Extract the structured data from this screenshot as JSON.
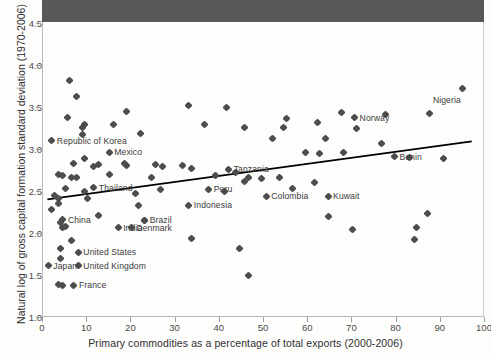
{
  "chart_data": {
    "type": "scatter",
    "title": "",
    "xlabel": "Primary commodities as a percentage of total exports (2000-2006)",
    "ylabel": "Natural log of gross capital formation standard deviation (1970-2006)",
    "xlim": [
      0,
      100
    ],
    "ylim": [
      1.0,
      4.5
    ],
    "xticks": [
      0,
      10,
      20,
      30,
      40,
      50,
      60,
      70,
      80,
      90,
      100
    ],
    "xticklabels": [
      "0",
      "10",
      "20",
      "30",
      "40",
      "50",
      "60",
      "70",
      "80",
      "90",
      "100"
    ],
    "yticks": [
      1.0,
      1.5,
      2.0,
      2.5,
      3.0,
      3.5,
      4.0,
      4.5
    ],
    "yticklabels": [
      "1.0",
      "1.5",
      "2.0",
      "2.5",
      "3.0",
      "3.5",
      "4.0",
      "4.5"
    ],
    "grid": false,
    "legend": "none",
    "marker": "diamond",
    "marker_color": "#4d4d4d",
    "trendline": {
      "label": "linear fit",
      "color": "#000000",
      "x_start": 1.0,
      "y_start": 2.4,
      "x_end": 97.0,
      "y_end": 3.09
    },
    "labeled_points": [
      {
        "name": "Republic of Korea",
        "x": 2.0,
        "y": 3.1,
        "label_side": "right"
      },
      {
        "name": "Mexico",
        "x": 15.0,
        "y": 2.96,
        "label_side": "right"
      },
      {
        "name": "Thailand",
        "x": 11.5,
        "y": 2.54,
        "label_side": "right"
      },
      {
        "name": "China",
        "x": 4.5,
        "y": 2.16,
        "label_side": "right"
      },
      {
        "name": "India",
        "x": 17.0,
        "y": 2.06,
        "label_side": "right"
      },
      {
        "name": "Denmark",
        "x": 20.0,
        "y": 2.06,
        "label_side": "right"
      },
      {
        "name": "Brazil",
        "x": 23.0,
        "y": 2.15,
        "label_side": "right"
      },
      {
        "name": "United States",
        "x": 8.0,
        "y": 1.77,
        "label_side": "right"
      },
      {
        "name": "United Kingdom",
        "x": 8.0,
        "y": 1.61,
        "label_side": "right"
      },
      {
        "name": "Japan",
        "x": 1.2,
        "y": 1.61,
        "label_side": "right"
      },
      {
        "name": "France",
        "x": 7.0,
        "y": 1.38,
        "label_side": "right"
      },
      {
        "name": "Indonesia",
        "x": 33.0,
        "y": 2.33,
        "label_side": "right"
      },
      {
        "name": "Peru",
        "x": 37.5,
        "y": 2.52,
        "label_side": "right"
      },
      {
        "name": "Tanzania",
        "x": 42.0,
        "y": 2.76,
        "label_side": "right"
      },
      {
        "name": "Colombia",
        "x": 50.5,
        "y": 2.44,
        "label_side": "right"
      },
      {
        "name": "Kuwait",
        "x": 64.5,
        "y": 2.44,
        "label_side": "right"
      },
      {
        "name": "Norway",
        "x": 70.5,
        "y": 3.37,
        "label_side": "right"
      },
      {
        "name": "Benin",
        "x": 79.5,
        "y": 2.91,
        "label_side": "right"
      },
      {
        "name": "Nigeria",
        "x": 95.0,
        "y": 3.72,
        "label_side": "below-left"
      }
    ],
    "unlabeled_points": [
      {
        "x": 6.0,
        "y": 3.81
      },
      {
        "x": 7.5,
        "y": 3.63
      },
      {
        "x": 5.5,
        "y": 3.37
      },
      {
        "x": 19.0,
        "y": 3.45
      },
      {
        "x": 9.5,
        "y": 3.29
      },
      {
        "x": 9.0,
        "y": 3.26
      },
      {
        "x": 16.0,
        "y": 3.29
      },
      {
        "x": 9.0,
        "y": 3.17
      },
      {
        "x": 22.0,
        "y": 3.18
      },
      {
        "x": 33.0,
        "y": 3.52
      },
      {
        "x": 41.5,
        "y": 3.49
      },
      {
        "x": 36.5,
        "y": 3.29
      },
      {
        "x": 45.5,
        "y": 3.26
      },
      {
        "x": 55.0,
        "y": 3.36
      },
      {
        "x": 54.5,
        "y": 3.26
      },
      {
        "x": 52.0,
        "y": 3.12
      },
      {
        "x": 62.0,
        "y": 3.32
      },
      {
        "x": 67.5,
        "y": 3.44
      },
      {
        "x": 71.0,
        "y": 3.24
      },
      {
        "x": 77.5,
        "y": 3.41
      },
      {
        "x": 87.5,
        "y": 3.42
      },
      {
        "x": 9.5,
        "y": 2.89
      },
      {
        "x": 7.0,
        "y": 2.83
      },
      {
        "x": 12.5,
        "y": 2.81
      },
      {
        "x": 18.5,
        "y": 2.83
      },
      {
        "x": 25.5,
        "y": 2.81
      },
      {
        "x": 31.5,
        "y": 2.8
      },
      {
        "x": 59.5,
        "y": 2.96
      },
      {
        "x": 62.5,
        "y": 2.95
      },
      {
        "x": 64.0,
        "y": 3.12
      },
      {
        "x": 68.0,
        "y": 2.96
      },
      {
        "x": 76.5,
        "y": 3.07
      },
      {
        "x": 4.5,
        "y": 2.68
      },
      {
        "x": 3.5,
        "y": 2.7
      },
      {
        "x": 6.5,
        "y": 2.66
      },
      {
        "x": 7.5,
        "y": 2.66
      },
      {
        "x": 11.5,
        "y": 2.79
      },
      {
        "x": 15.0,
        "y": 2.7
      },
      {
        "x": 19.0,
        "y": 2.8
      },
      {
        "x": 24.5,
        "y": 2.66
      },
      {
        "x": 27.0,
        "y": 2.79
      },
      {
        "x": 33.5,
        "y": 2.77
      },
      {
        "x": 39.0,
        "y": 2.69
      },
      {
        "x": 43.5,
        "y": 2.72
      },
      {
        "x": 46.5,
        "y": 2.66
      },
      {
        "x": 49.5,
        "y": 2.65
      },
      {
        "x": 53.5,
        "y": 2.66
      },
      {
        "x": 2.5,
        "y": 2.45
      },
      {
        "x": 3.5,
        "y": 2.41
      },
      {
        "x": 5.0,
        "y": 2.53
      },
      {
        "x": 9.5,
        "y": 2.5
      },
      {
        "x": 10.0,
        "y": 2.41
      },
      {
        "x": 21.0,
        "y": 2.47
      },
      {
        "x": 21.5,
        "y": 2.33
      },
      {
        "x": 26.5,
        "y": 2.52
      },
      {
        "x": 41.0,
        "y": 2.49
      },
      {
        "x": 45.5,
        "y": 2.61
      },
      {
        "x": 56.5,
        "y": 2.53
      },
      {
        "x": 61.5,
        "y": 2.6
      },
      {
        "x": 2.0,
        "y": 2.28
      },
      {
        "x": 3.5,
        "y": 2.35
      },
      {
        "x": 4.0,
        "y": 2.13
      },
      {
        "x": 4.5,
        "y": 2.06
      },
      {
        "x": 5.0,
        "y": 2.08
      },
      {
        "x": 12.5,
        "y": 2.21
      },
      {
        "x": 23.0,
        "y": 2.15
      },
      {
        "x": 6.5,
        "y": 1.91
      },
      {
        "x": 33.5,
        "y": 1.93
      },
      {
        "x": 44.5,
        "y": 1.81
      },
      {
        "x": 4.0,
        "y": 1.81
      },
      {
        "x": 4.0,
        "y": 1.7
      },
      {
        "x": 46.5,
        "y": 1.49
      },
      {
        "x": 3.5,
        "y": 1.39
      },
      {
        "x": 4.5,
        "y": 1.38
      },
      {
        "x": 64.5,
        "y": 2.2
      },
      {
        "x": 70.0,
        "y": 2.04
      },
      {
        "x": 84.5,
        "y": 2.07
      },
      {
        "x": 84.0,
        "y": 1.92
      },
      {
        "x": 87.0,
        "y": 2.23
      },
      {
        "x": 83.0,
        "y": 2.9
      },
      {
        "x": 90.5,
        "y": 2.89
      }
    ]
  }
}
